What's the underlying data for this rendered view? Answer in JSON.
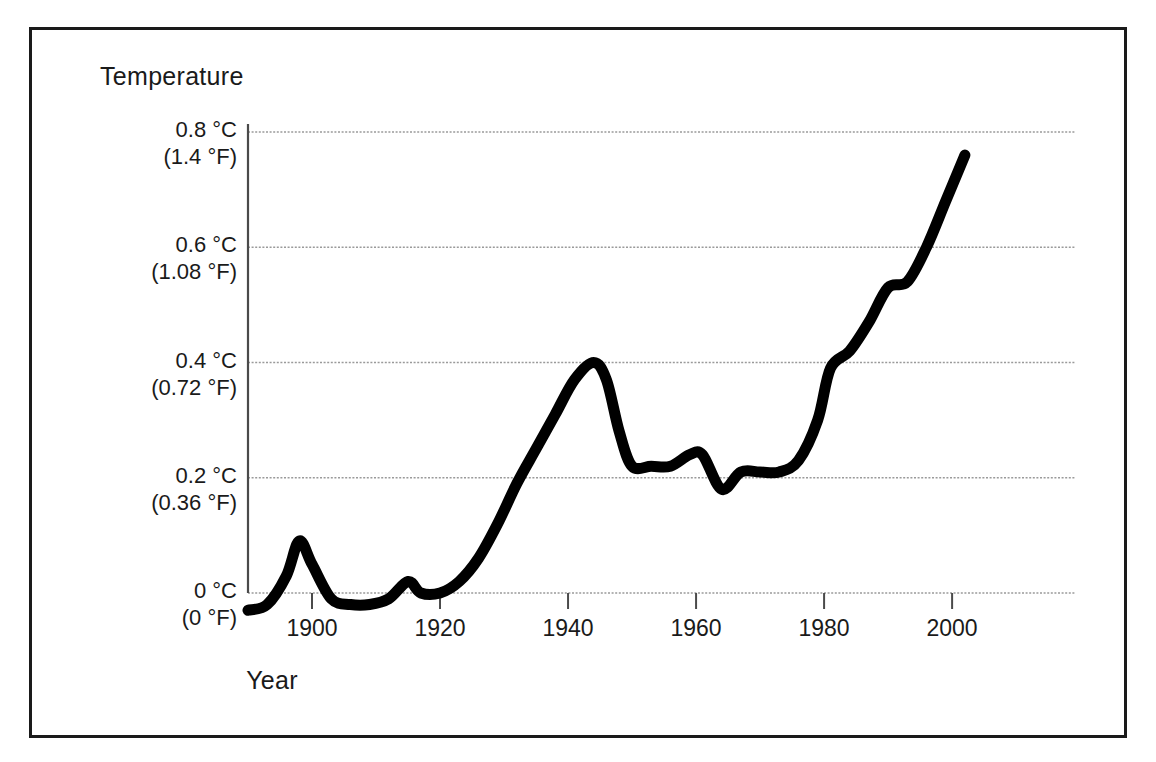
{
  "figure": {
    "background_color": "#ffffff",
    "frame_color": "#1a1a1a",
    "line_color": "#000000",
    "grid_color": "#9a9a9a",
    "axis_color": "#4a4a4a"
  },
  "axes": {
    "y_title": "Temperature",
    "x_title": "Year"
  },
  "y_ticks": [
    {
      "celsius": "0.8 °C",
      "fahrenheit": "(1.4 °F)",
      "value": 0.8
    },
    {
      "celsius": "0.6 °C",
      "fahrenheit": "(1.08 °F)",
      "value": 0.6
    },
    {
      "celsius": "0.4 °C",
      "fahrenheit": "(0.72 °F)",
      "value": 0.4
    },
    {
      "celsius": "0.2 °C",
      "fahrenheit": "(0.36 °F)",
      "value": 0.2
    },
    {
      "celsius": "0 °C",
      "fahrenheit": "(0 °F)",
      "value": 0
    }
  ],
  "x_ticks": [
    {
      "label": "1900",
      "value": 1900
    },
    {
      "label": "1920",
      "value": 1920
    },
    {
      "label": "1940",
      "value": 1940
    },
    {
      "label": "1960",
      "value": 1960
    },
    {
      "label": "1980",
      "value": 1980
    },
    {
      "label": "2000",
      "value": 2000
    }
  ],
  "chart_data": {
    "type": "line",
    "title": "",
    "xlabel": "Year",
    "ylabel": "Temperature",
    "xlim": [
      1890,
      2003
    ],
    "ylim": [
      -0.06,
      0.82
    ],
    "grid": true,
    "legend": null,
    "y_unit_primary": "°C",
    "y_unit_secondary": "°F",
    "y_tick_values": [
      0,
      0.2,
      0.4,
      0.6,
      0.8
    ],
    "y_tick_labels_c": [
      "0 °C",
      "0.2 °C",
      "0.4 °C",
      "0.6 °C",
      "0.8 °C"
    ],
    "y_tick_labels_f": [
      "(0 °F)",
      "(0.36 °F)",
      "(0.72 °F)",
      "(1.08 °F)",
      "(1.4 °F)"
    ],
    "x_tick_values": [
      1900,
      1920,
      1940,
      1960,
      1980,
      2000
    ],
    "series": [
      {
        "name": "Global mean temperature anomaly",
        "x": [
          1890,
          1893,
          1896,
          1898,
          1900,
          1903,
          1906,
          1909,
          1912,
          1915,
          1917,
          1920,
          1923,
          1926,
          1929,
          1932,
          1935,
          1938,
          1941,
          1944,
          1946,
          1948,
          1950,
          1953,
          1956,
          1959,
          1961,
          1964,
          1967,
          1970,
          1973,
          1976,
          1979,
          1981,
          1984,
          1987,
          1990,
          1993,
          1996,
          1999,
          2002
        ],
        "y": [
          -0.03,
          -0.02,
          0.03,
          0.09,
          0.05,
          -0.01,
          -0.02,
          -0.02,
          -0.01,
          0.02,
          0.0,
          0.0,
          0.02,
          0.06,
          0.12,
          0.19,
          0.25,
          0.31,
          0.37,
          0.4,
          0.37,
          0.28,
          0.22,
          0.22,
          0.22,
          0.24,
          0.24,
          0.18,
          0.21,
          0.21,
          0.21,
          0.23,
          0.3,
          0.39,
          0.42,
          0.47,
          0.53,
          0.54,
          0.6,
          0.68,
          0.76
        ]
      }
    ]
  },
  "geometry": {
    "plot_left_px": 248,
    "plot_right_px": 1075,
    "plot_top_px": 132,
    "plot_bottom_px": 593,
    "x_min_year": 1890,
    "x_max_year": 2019.2,
    "y_min_value": 0,
    "y_max_value": 0.8
  }
}
